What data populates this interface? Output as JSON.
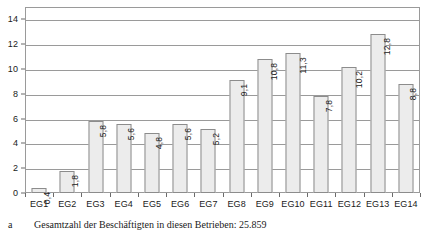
{
  "chart_data": {
    "type": "bar",
    "title": "",
    "subtitle": "",
    "xlabel": "",
    "ylabel": "",
    "categories": [
      "EG1",
      "EG2",
      "EG3",
      "EG4",
      "EG5",
      "EG6",
      "EG7",
      "EG8",
      "EG9",
      "EG10",
      "EG11",
      "EG12",
      "EG13",
      "EG14"
    ],
    "values": [
      0.4,
      1.8,
      5.8,
      5.6,
      4.8,
      5.6,
      5.2,
      9.1,
      10.8,
      11.3,
      7.8,
      10.2,
      12.8,
      8.8
    ],
    "value_labels": [
      "0,4",
      "1,8",
      "5,8",
      "5,6",
      "4,8",
      "5,6",
      "5,2",
      "9,1",
      "10,8",
      "11,3",
      "7,8",
      "10,2",
      "12,8",
      "8,8"
    ],
    "ylim": [
      0,
      15
    ],
    "yticks": [
      0,
      2,
      4,
      6,
      8,
      10,
      12,
      14
    ],
    "ytick_labels": [
      "0",
      "2",
      "4",
      "6",
      "8",
      "10",
      "12",
      "14"
    ],
    "grid": true,
    "grid_axis": "y",
    "legend": false,
    "legend_position": "none",
    "bar_color": "#ececec",
    "bar_border_color": "#8c8c8c",
    "axis_color": "#9a9a9a",
    "text_color": "#1a1a1a",
    "value_label_orientation": "vertical",
    "value_label_position": "inside-top"
  },
  "footnote": {
    "marker": "a",
    "text": "Gesamtzahl der Beschäftigten in diesen Betrieben: 25.859"
  }
}
